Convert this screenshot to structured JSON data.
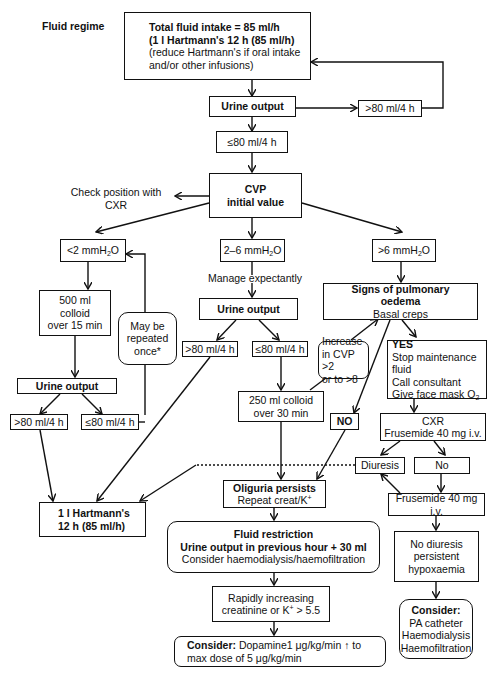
{
  "title": "Fluid regime",
  "nodes": {
    "start": {
      "line1": "Total fluid intake = 85 ml/h",
      "line2": "(1 l Hartmann's 12 h (85 ml/h)",
      "line3": "(reduce Hartmann's if oral intake",
      "line4": "and/or other infusions)"
    },
    "urine_output_1": {
      "label": "Urine output"
    },
    "gt80_top": {
      "label": ">80 ml/4 h"
    },
    "le80_top": {
      "label": "≤80 ml/4 h"
    },
    "check_cxr": {
      "line1": "Check position with",
      "line2": "CXR"
    },
    "cvp": {
      "line1": "CVP",
      "line2": "initial value"
    },
    "lt2": {
      "label": "<2 mmH",
      "sub": "2",
      "suffix": "O"
    },
    "r2_6": {
      "label": "2–6 mmH",
      "sub": "2",
      "suffix": "O"
    },
    "gt6": {
      "label": ">6 mmH",
      "sub": "2",
      "suffix": "O"
    },
    "colloid500": {
      "line1": "500 ml",
      "line2": "colloid",
      "line3": "over 15 min"
    },
    "may_repeat": {
      "line1": "May be",
      "line2": "repeated",
      "line3": "once*"
    },
    "manage": {
      "label": "Manage expectantly"
    },
    "urine_output_mid": {
      "label": "Urine output"
    },
    "mid_gt80": {
      "label": ">80 ml/4 h"
    },
    "mid_le80": {
      "label": "≤80 ml/4 h"
    },
    "pulm": {
      "line1": "Signs of pulmonary",
      "line2": "oedema",
      "line3": "Basal creps"
    },
    "increase_cvp": {
      "line1": "Increase",
      "line2": "in CVP >2",
      "line3": "or to >8"
    },
    "yes": {
      "line1": "YES",
      "line2": "Stop maintenance fluid",
      "line3": "Call consultant",
      "line4": "Give face mask O",
      "sub": "2"
    },
    "urine_output_left": {
      "label": "Urine output"
    },
    "left_gt80": {
      "label": ">80 ml/4 h"
    },
    "left_le80": {
      "label": "≤80 ml/4 h"
    },
    "colloid250": {
      "line1": "250 ml colloid",
      "line2": "over 30 min"
    },
    "no_box": {
      "label": "NO"
    },
    "cxr_frus": {
      "line1": "CXR",
      "line2": "Frusemide 40 mg i.v."
    },
    "diuresis": {
      "label": "Diuresis"
    },
    "no2": {
      "label": "No"
    },
    "hartmann": {
      "line1": "1 l Hartmann's",
      "line2": "12 h (85 ml/h)"
    },
    "oliguria": {
      "line1": "Oliguria persists",
      "line2": "Repeat creat/K",
      "sup": "+"
    },
    "frus2": {
      "label": "Frusemide 40 mg i.v."
    },
    "restriction": {
      "line1": "Fluid restriction",
      "line2": "Urine output in previous hour + 30 ml",
      "line3": "Consider haemodialysis/haemofiltration"
    },
    "no_diuresis": {
      "line1": "No diuresis",
      "line2": "persistent",
      "line3": "hypoxaemia"
    },
    "creatinine": {
      "line1": "Rapidly increasing",
      "line2": "creatinine or K",
      "sup": "+",
      "line2b": " > 5.5"
    },
    "consider_right": {
      "line1": "Consider:",
      "line2": "PA catheter",
      "line3": "Haemodialysis",
      "line4": "Haemofiltration"
    },
    "dopamine": {
      "bold": "Consider:",
      "line1": " Dopamine1 μg/kg/min ↑ to",
      "line2": "max dose of 5 μg/kg/min"
    }
  }
}
